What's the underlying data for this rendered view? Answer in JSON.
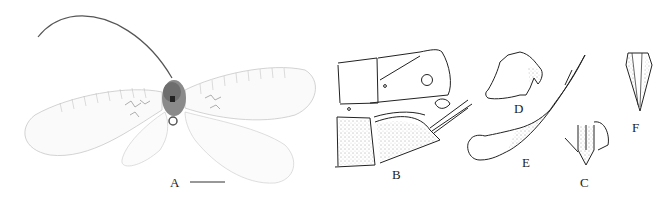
{
  "figure": {
    "panels": [
      {
        "id": "A",
        "label": "A",
        "description": "Habitus photograph of adult lacewing, dorsal view, wings spread",
        "scale_bar": true
      },
      {
        "id": "B",
        "label": "B",
        "description": "Terminal abdominal segments, lateral view (line drawing)"
      },
      {
        "id": "C",
        "label": "C",
        "description": "Genital structure, ventral view"
      },
      {
        "id": "D",
        "label": "D",
        "description": "Sclerite, lateral view"
      },
      {
        "id": "E",
        "label": "E",
        "description": "Elongate curved process with stippled distal part"
      },
      {
        "id": "F",
        "label": "F",
        "description": "Narrow triangular structure"
      }
    ],
    "colors": {
      "ink": "#222222",
      "wing": "#b8b8b8",
      "body": "#6e6e6e",
      "background": "#ffffff"
    }
  }
}
